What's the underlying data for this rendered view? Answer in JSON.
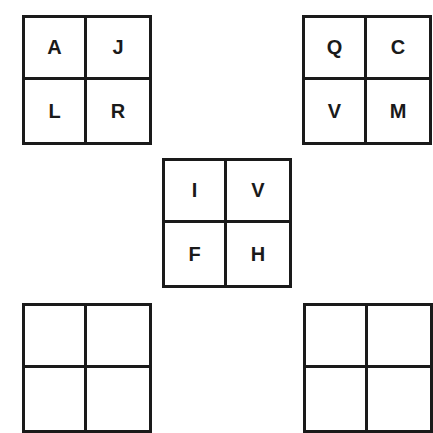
{
  "grids": [
    {
      "cells": [
        "A",
        "J",
        "L",
        "R"
      ]
    },
    {
      "cells": [
        "Q",
        "C",
        "V",
        "M"
      ]
    },
    {
      "cells": [
        "I",
        "V",
        "F",
        "H"
      ]
    },
    {
      "cells": [
        "",
        "",
        "",
        ""
      ]
    },
    {
      "cells": [
        "",
        "",
        "",
        ""
      ]
    }
  ]
}
